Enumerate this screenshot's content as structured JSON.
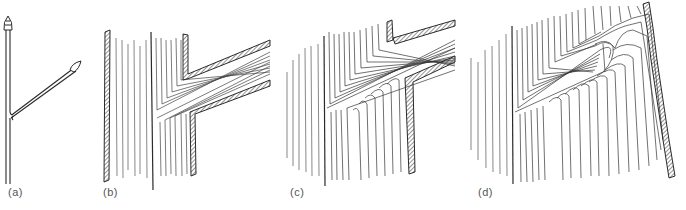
{
  "figure": {
    "panels": [
      {
        "id": "a",
        "label": "(a)",
        "description": "twig with terminal and lateral buds"
      },
      {
        "id": "b",
        "label": "(b)",
        "description": "branch joining stem, grain lines"
      },
      {
        "id": "c",
        "label": "(c)",
        "description": "branch embedded in stem, later growth"
      },
      {
        "id": "d",
        "label": "(d)",
        "description": "branch stub overgrown (knot)"
      }
    ],
    "colors": {
      "line": "#2a2a2a",
      "background": "#ffffff",
      "label": "#555555"
    }
  }
}
